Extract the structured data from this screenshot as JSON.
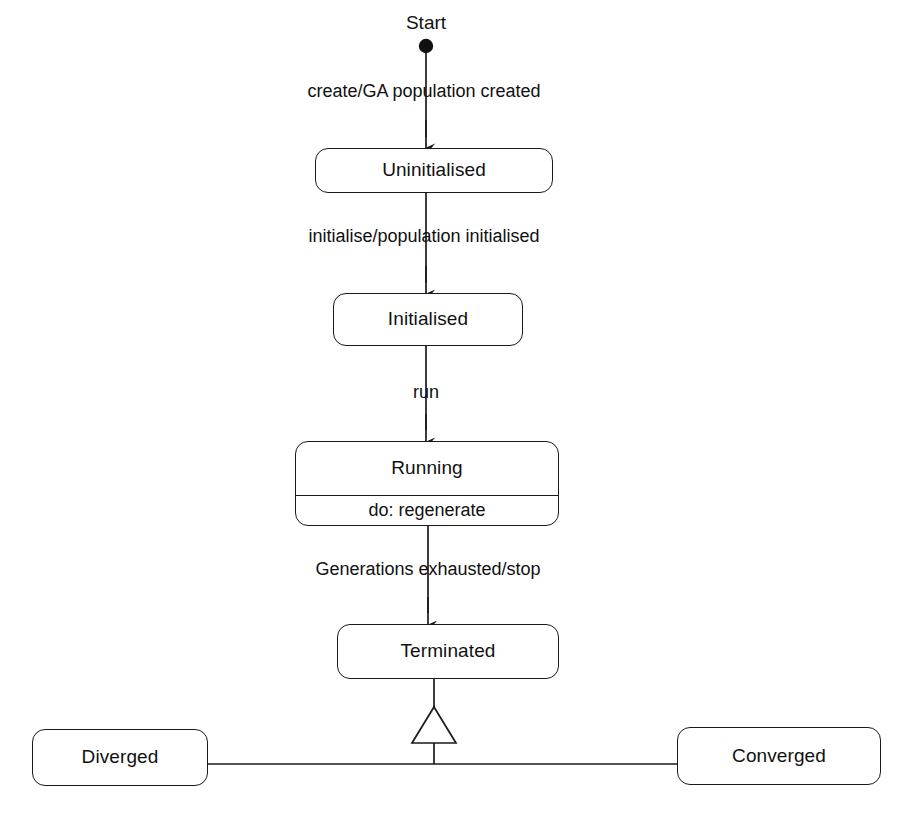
{
  "diagram": {
    "type": "uml-state-machine-diagram",
    "stroke_color": "#1a1a1a",
    "text_color": "#111111",
    "background_color": "#ffffff"
  },
  "start": {
    "label": "Start",
    "node_name": "initial-pseudostate"
  },
  "states": [
    {
      "id": "uninitialised",
      "name": "Uninitialised",
      "activity": null
    },
    {
      "id": "initialised",
      "name": "Initialised",
      "activity": null
    },
    {
      "id": "running",
      "name": "Running",
      "activity": "do: regenerate"
    },
    {
      "id": "terminated",
      "name": "Terminated",
      "activity": null
    },
    {
      "id": "diverged",
      "name": "Diverged",
      "activity": null
    },
    {
      "id": "converged",
      "name": "Converged",
      "activity": null
    }
  ],
  "transitions": [
    {
      "id": "t1",
      "from": "start",
      "to": "uninitialised",
      "label": "create/GA population created"
    },
    {
      "id": "t2",
      "from": "uninitialised",
      "to": "initialised",
      "label": "initialise/population initialised"
    },
    {
      "id": "t3",
      "from": "initialised",
      "to": "running",
      "label": "run"
    },
    {
      "id": "t4",
      "from": "running",
      "to": "terminated",
      "label": "Generations exhausted/stop"
    }
  ],
  "generalization": {
    "parent": "terminated",
    "children": [
      "diverged",
      "converged"
    ],
    "arrow_style": "hollow-triangle"
  }
}
